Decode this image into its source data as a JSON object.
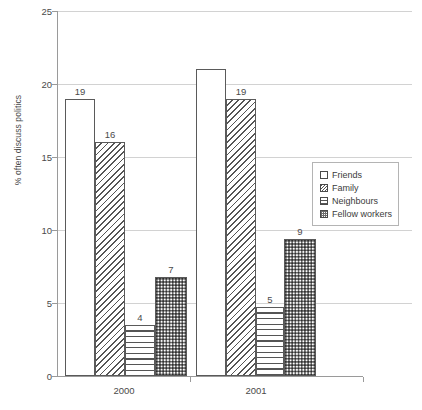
{
  "chart_data": {
    "type": "bar",
    "title": "",
    "xlabel": "",
    "ylabel": "% often discuss politics",
    "categories": [
      "2000",
      "2001"
    ],
    "ylim": [
      0,
      25
    ],
    "yticks": [
      0,
      5,
      10,
      15,
      20,
      25
    ],
    "grid": true,
    "legend_position": "right",
    "series": [
      {
        "name": "Friends",
        "pattern": "solid-white",
        "values": [
          19,
          21
        ],
        "labels": [
          "19",
          ""
        ]
      },
      {
        "name": "Family",
        "pattern": "diagonal-hatch",
        "values": [
          16,
          19
        ],
        "labels": [
          "16",
          "19"
        ]
      },
      {
        "name": "Neighbours",
        "pattern": "horizontal-lines",
        "values": [
          3.5,
          4.7
        ],
        "labels": [
          "4",
          "5"
        ]
      },
      {
        "name": "Fellow workers",
        "pattern": "checker-dots",
        "values": [
          6.8,
          9.4
        ],
        "labels": [
          "7",
          "9"
        ]
      }
    ]
  },
  "axis": {
    "y_label": "% often discuss politics",
    "y_ticks": [
      "0",
      "5",
      "10",
      "15",
      "20",
      "25"
    ],
    "x_ticks": [
      "2000",
      "2001"
    ]
  },
  "legend": {
    "items": [
      {
        "label": "Friends",
        "pattern": "solid-white"
      },
      {
        "label": "Family",
        "pattern": "diagonal-hatch"
      },
      {
        "label": "Neighbours",
        "pattern": "horizontal-lines"
      },
      {
        "label": "Fellow workers",
        "pattern": "checker-dots"
      }
    ]
  },
  "colors": {
    "background": "#ffffff",
    "gridline": "#d2d2d2",
    "axis": "#9a9a9a",
    "bar_outline": "#5a5a5a",
    "text": "#4a4a4a",
    "pattern_ink": "#555555"
  }
}
